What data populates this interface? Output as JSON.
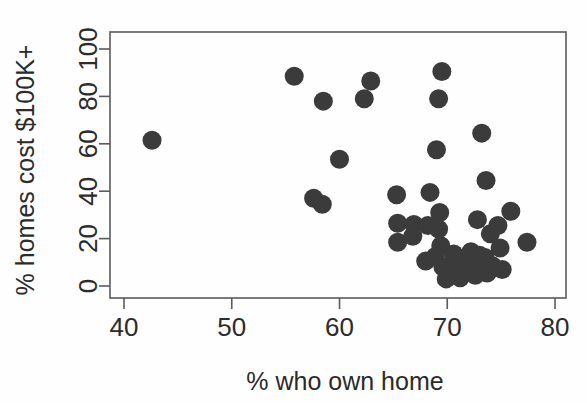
{
  "chart_data": {
    "type": "scatter",
    "title": "",
    "xlabel": "% who own home",
    "ylabel": "% homes cost $100K+",
    "xlim": [
      39,
      81
    ],
    "ylim": [
      -4,
      104
    ],
    "xticks": [
      40,
      50,
      60,
      70,
      80
    ],
    "yticks": [
      0,
      20,
      40,
      60,
      80,
      100
    ],
    "grid": false,
    "legend": "none",
    "marker": "filled-circle",
    "marker_color": "#3b3b3b",
    "points": [
      {
        "x": 42.6,
        "y": 61.5
      },
      {
        "x": 55.8,
        "y": 88.5
      },
      {
        "x": 58.5,
        "y": 78.0
      },
      {
        "x": 60.0,
        "y": 53.5
      },
      {
        "x": 62.3,
        "y": 79.0
      },
      {
        "x": 62.9,
        "y": 86.5
      },
      {
        "x": 69.5,
        "y": 90.5
      },
      {
        "x": 69.2,
        "y": 79.0
      },
      {
        "x": 69.0,
        "y": 57.5
      },
      {
        "x": 73.2,
        "y": 64.5
      },
      {
        "x": 73.6,
        "y": 44.5
      },
      {
        "x": 57.6,
        "y": 37.0
      },
      {
        "x": 58.4,
        "y": 34.5
      },
      {
        "x": 65.3,
        "y": 38.5
      },
      {
        "x": 68.4,
        "y": 39.5
      },
      {
        "x": 65.4,
        "y": 26.5
      },
      {
        "x": 65.4,
        "y": 18.5
      },
      {
        "x": 66.9,
        "y": 26.0
      },
      {
        "x": 66.8,
        "y": 21.0
      },
      {
        "x": 68.2,
        "y": 25.5
      },
      {
        "x": 69.3,
        "y": 31.0
      },
      {
        "x": 69.2,
        "y": 24.0
      },
      {
        "x": 68.0,
        "y": 10.5
      },
      {
        "x": 68.9,
        "y": 12.5
      },
      {
        "x": 69.4,
        "y": 17.0
      },
      {
        "x": 69.6,
        "y": 8.0
      },
      {
        "x": 69.9,
        "y": 3.0
      },
      {
        "x": 70.4,
        "y": 5.0
      },
      {
        "x": 70.6,
        "y": 13.5
      },
      {
        "x": 71.0,
        "y": 9.0
      },
      {
        "x": 71.2,
        "y": 3.5
      },
      {
        "x": 71.6,
        "y": 11.5
      },
      {
        "x": 71.9,
        "y": 6.5
      },
      {
        "x": 72.2,
        "y": 14.5
      },
      {
        "x": 72.4,
        "y": 9.5
      },
      {
        "x": 72.6,
        "y": 4.5
      },
      {
        "x": 73.0,
        "y": 13.0
      },
      {
        "x": 73.1,
        "y": 7.5
      },
      {
        "x": 73.5,
        "y": 12.0
      },
      {
        "x": 73.7,
        "y": 5.5
      },
      {
        "x": 72.8,
        "y": 28.0
      },
      {
        "x": 74.0,
        "y": 22.0
      },
      {
        "x": 74.2,
        "y": 8.5
      },
      {
        "x": 74.7,
        "y": 25.5
      },
      {
        "x": 74.9,
        "y": 16.0
      },
      {
        "x": 75.1,
        "y": 7.0
      },
      {
        "x": 75.9,
        "y": 31.5
      },
      {
        "x": 77.4,
        "y": 18.5
      }
    ]
  },
  "axes": {
    "x_tick_labels": [
      "40",
      "50",
      "60",
      "70",
      "80"
    ],
    "y_tick_labels": [
      "0",
      "20",
      "40",
      "60",
      "80",
      "100"
    ]
  }
}
